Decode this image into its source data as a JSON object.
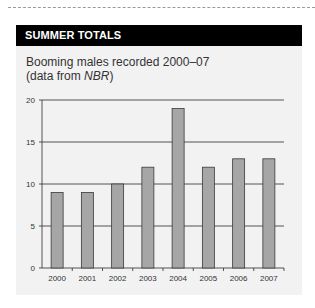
{
  "header": {
    "title": "SUMMER TOTALS"
  },
  "subtitle": {
    "line1": "Booming males recorded 2000–07",
    "line2_prefix": "(data from ",
    "line2_source": "NBR",
    "line2_suffix": ")"
  },
  "colors": {
    "header_bg": "#000000",
    "panel_bg": "#f2f2f2",
    "bar_fill": "#a6a6a6",
    "bar_stroke": "#3a3a3a",
    "grid": "#2b2b2b"
  },
  "chart_data": {
    "type": "bar",
    "title": "SUMMER TOTALS",
    "subtitle": "Booming males recorded 2000–07 (data from NBR)",
    "categories": [
      "2000",
      "2001",
      "2002",
      "2003",
      "2004",
      "2005",
      "2006",
      "2007"
    ],
    "values": [
      9,
      9,
      10,
      12,
      19,
      12,
      13,
      13
    ],
    "xlabel": "",
    "ylabel": "",
    "ylim": [
      0,
      20
    ],
    "yticks": [
      0,
      5,
      10,
      15,
      20
    ],
    "grid": true,
    "legend": null
  }
}
